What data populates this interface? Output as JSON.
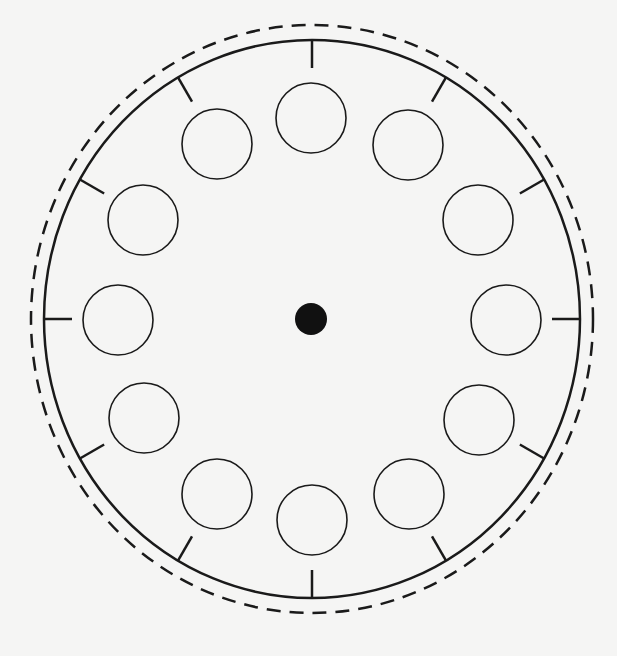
{
  "diagram": {
    "type": "clock-face",
    "background": "#f5f5f4",
    "stroke_color": "#1a1a1a",
    "center": {
      "x": 312,
      "y": 319
    },
    "outer_dashed_ring": {
      "rx": 281,
      "ry": 294,
      "stroke_width": 2.5,
      "dash": [
        14,
        9
      ]
    },
    "main_ring": {
      "rx": 268,
      "ry": 279,
      "stroke_width": 2.5
    },
    "ticks": {
      "count": 12,
      "length": 28,
      "stroke_width": 2.5
    },
    "hour_circles": {
      "count": 12,
      "radius": 35,
      "orbit_rx": 197,
      "orbit_ry": 201,
      "stroke_width": 1.6,
      "positions": [
        {
          "hour": 12,
          "x": 311,
          "y": 118
        },
        {
          "hour": 1,
          "x": 408,
          "y": 145
        },
        {
          "hour": 2,
          "x": 478,
          "y": 220
        },
        {
          "hour": 3,
          "x": 506,
          "y": 320
        },
        {
          "hour": 4,
          "x": 479,
          "y": 420
        },
        {
          "hour": 5,
          "x": 409,
          "y": 494
        },
        {
          "hour": 6,
          "x": 312,
          "y": 520
        },
        {
          "hour": 7,
          "x": 217,
          "y": 494
        },
        {
          "hour": 8,
          "x": 144,
          "y": 418
        },
        {
          "hour": 9,
          "x": 118,
          "y": 320
        },
        {
          "hour": 10,
          "x": 143,
          "y": 220
        },
        {
          "hour": 11,
          "x": 217,
          "y": 144
        }
      ]
    },
    "center_dot": {
      "x": 311,
      "y": 319,
      "r": 16,
      "fill": "#111111"
    }
  }
}
